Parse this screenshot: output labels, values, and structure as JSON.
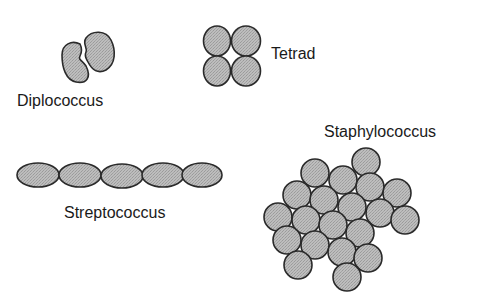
{
  "colors": {
    "fill": "#b4b4b4",
    "stroke": "#2a2a2a",
    "text": "#1a1a1a",
    "background": "#ffffff"
  },
  "labels": {
    "diplococcus": "Diplococcus",
    "tetrad": "Tetrad",
    "streptococcus": "Streptococcus",
    "staphylococcus": "Staphylococcus"
  },
  "shapes": {
    "diplococcus": [
      {
        "type": "bean",
        "path": "M 80 44 C 72 40, 62 44, 62 55 C 62 68, 66 80, 76 82 C 86 84, 92 78, 86 66 C 82 60, 78 60, 80 56 C 82 52, 82 48, 80 44 Z"
      },
      {
        "type": "bean",
        "path": "M 86 38 C 92 30, 106 30, 111 40 C 116 50, 116 64, 106 70 C 98 74, 92 70, 88 62 C 86 58, 84 56, 86 52 C 88 48, 82 44, 86 38 Z"
      }
    ],
    "tetrad": [
      {
        "cx": 217,
        "cy": 41,
        "rx": 13.5,
        "ry": 15
      },
      {
        "cx": 246,
        "cy": 41,
        "rx": 14.5,
        "ry": 15
      },
      {
        "cx": 217,
        "cy": 71,
        "rx": 13.5,
        "ry": 15
      },
      {
        "cx": 246,
        "cy": 71,
        "rx": 14.5,
        "ry": 15
      }
    ],
    "streptococcus": [
      {
        "cx": 38,
        "cy": 175,
        "rx": 21,
        "ry": 12
      },
      {
        "cx": 80,
        "cy": 175,
        "rx": 21,
        "ry": 12
      },
      {
        "cx": 122,
        "cy": 176,
        "rx": 21,
        "ry": 12
      },
      {
        "cx": 163,
        "cy": 175,
        "rx": 21,
        "ry": 12
      },
      {
        "cx": 202,
        "cy": 175,
        "rx": 20,
        "ry": 12
      }
    ],
    "staphylococcus": [
      {
        "cx": 366,
        "cy": 162,
        "r": 14
      },
      {
        "cx": 315,
        "cy": 173,
        "r": 14
      },
      {
        "cx": 343,
        "cy": 180,
        "r": 14
      },
      {
        "cx": 370,
        "cy": 187,
        "r": 14
      },
      {
        "cx": 397,
        "cy": 193,
        "r": 14
      },
      {
        "cx": 297,
        "cy": 195,
        "r": 14
      },
      {
        "cx": 324,
        "cy": 200,
        "r": 14
      },
      {
        "cx": 352,
        "cy": 207,
        "r": 14
      },
      {
        "cx": 380,
        "cy": 213,
        "r": 14
      },
      {
        "cx": 405,
        "cy": 220,
        "r": 14
      },
      {
        "cx": 278,
        "cy": 217,
        "r": 14
      },
      {
        "cx": 306,
        "cy": 220,
        "r": 14
      },
      {
        "cx": 333,
        "cy": 225,
        "r": 14
      },
      {
        "cx": 360,
        "cy": 233,
        "r": 14
      },
      {
        "cx": 287,
        "cy": 240,
        "r": 14
      },
      {
        "cx": 315,
        "cy": 245,
        "r": 14
      },
      {
        "cx": 342,
        "cy": 252,
        "r": 14
      },
      {
        "cx": 368,
        "cy": 258,
        "r": 14
      },
      {
        "cx": 298,
        "cy": 265,
        "r": 14
      },
      {
        "cx": 347,
        "cy": 277,
        "r": 14
      }
    ]
  }
}
